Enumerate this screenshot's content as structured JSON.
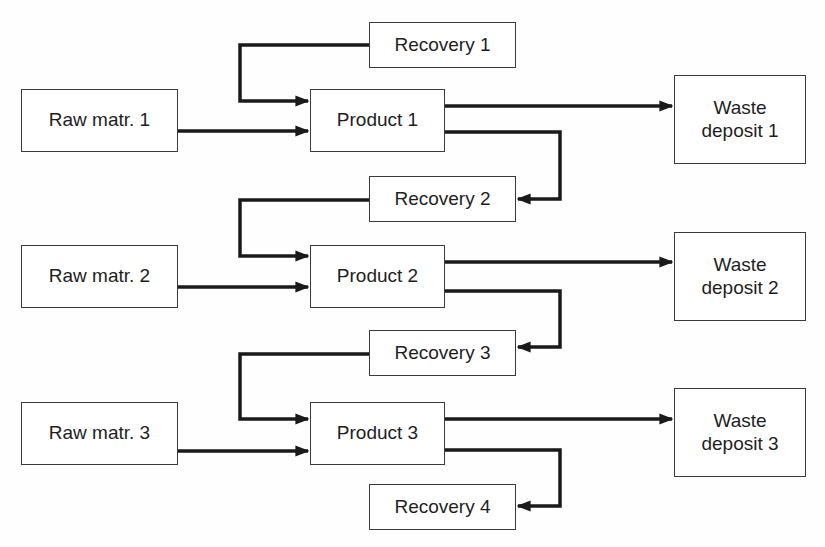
{
  "diagram": {
    "type": "process-flow",
    "colors": {
      "line": "#1a1a1a",
      "box_border": "#3a3a3a",
      "text": "#1e1e1e",
      "background": "#fefefe"
    },
    "nodes": {
      "raw1": {
        "label": "Raw matr. 1"
      },
      "raw2": {
        "label": "Raw matr. 2"
      },
      "raw3": {
        "label": "Raw matr. 3"
      },
      "product1": {
        "label": "Product 1"
      },
      "product2": {
        "label": "Product 2"
      },
      "product3": {
        "label": "Product 3"
      },
      "recovery1": {
        "label": "Recovery 1"
      },
      "recovery2": {
        "label": "Recovery 2"
      },
      "recovery3": {
        "label": "Recovery 3"
      },
      "recovery4": {
        "label": "Recovery 4"
      },
      "waste1": {
        "label": "Waste\ndeposit 1"
      },
      "waste2": {
        "label": "Waste\ndeposit 2"
      },
      "waste3": {
        "label": "Waste\ndeposit 3"
      }
    },
    "edges": [
      {
        "from": "raw1",
        "to": "product1"
      },
      {
        "from": "recovery1",
        "to": "product1"
      },
      {
        "from": "product1",
        "to": "waste1"
      },
      {
        "from": "product1",
        "to": "recovery2"
      },
      {
        "from": "raw2",
        "to": "product2"
      },
      {
        "from": "recovery2",
        "to": "product2"
      },
      {
        "from": "product2",
        "to": "waste2"
      },
      {
        "from": "product2",
        "to": "recovery3"
      },
      {
        "from": "raw3",
        "to": "product3"
      },
      {
        "from": "recovery3",
        "to": "product3"
      },
      {
        "from": "product3",
        "to": "waste3"
      },
      {
        "from": "product3",
        "to": "recovery4"
      }
    ]
  }
}
